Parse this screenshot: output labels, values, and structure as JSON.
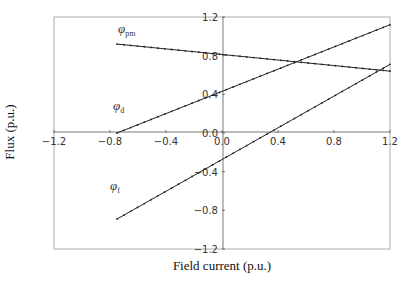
{
  "chart_data": {
    "type": "line",
    "title": "",
    "xlabel": "Field current (p.u.)",
    "ylabel": "Flux (p.u.)",
    "xlim": [
      -1.2,
      1.2
    ],
    "ylim": [
      -1.2,
      1.2
    ],
    "x_ticks": [
      "-1.2",
      "-0.8",
      "-0.4",
      "0.0",
      "0.4",
      "0.8",
      "1.2"
    ],
    "y_ticks": [
      "1.2",
      "0.8",
      "0.4",
      "0.0",
      "-0.4",
      "-0.8",
      "-1.2"
    ],
    "grid": false,
    "legend": "inline labels",
    "x": [
      -0.75,
      1.2
    ],
    "series": [
      {
        "name": "φpm",
        "symbol": "φ",
        "subscript": "pm",
        "values": [
          0.92,
          0.64
        ],
        "marker": "small dots"
      },
      {
        "name": "φd",
        "symbol": "φ",
        "subscript": "d",
        "values": [
          0.0,
          1.12
        ],
        "marker": "small dots"
      },
      {
        "name": "φf",
        "symbol": "φ",
        "subscript": "f",
        "values": [
          -0.89,
          0.71
        ],
        "marker": "small dots"
      }
    ]
  }
}
